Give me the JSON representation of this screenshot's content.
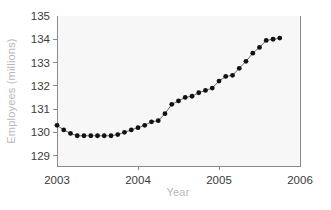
{
  "chart_data": {
    "type": "line",
    "title": "",
    "subtitle": "",
    "xlabel": "Year",
    "ylabel": "Employees (millions)",
    "xlim": [
      2003.0,
      2006.0
    ],
    "ylim": [
      128.55,
      135.0
    ],
    "xticks": [
      2003,
      2004,
      2005,
      2006
    ],
    "xtick_labels": [
      "2003",
      "2004",
      "2005",
      "2006"
    ],
    "yticks": [
      129,
      130,
      131,
      132,
      133,
      134,
      135
    ],
    "ytick_labels": [
      "129",
      "130",
      "131",
      "132",
      "133",
      "134",
      "135"
    ],
    "grid": false,
    "legend": null,
    "marker": "filled-circle",
    "line_color": "#6b6b6b",
    "marker_color": "#111111",
    "plot_background": "#f7f7f8",
    "axis_color": "#8a8a8e",
    "label_color": "#b9b9bd",
    "tick_label_color": "#3b3b3b",
    "series": [
      {
        "name": "Employees",
        "x": [
          2003.0,
          2003.083,
          2003.167,
          2003.25,
          2003.333,
          2003.417,
          2003.5,
          2003.583,
          2003.667,
          2003.75,
          2003.833,
          2003.917,
          2004.0,
          2004.083,
          2004.167,
          2004.25,
          2004.333,
          2004.417,
          2004.5,
          2004.583,
          2004.667,
          2004.75,
          2004.833,
          2004.917,
          2005.0,
          2005.083,
          2005.167,
          2005.25,
          2005.333,
          2005.417,
          2005.5,
          2005.583,
          2005.667,
          2005.75
        ],
        "y": [
          130.3,
          130.1,
          129.95,
          129.85,
          129.85,
          129.85,
          129.85,
          129.85,
          129.85,
          129.9,
          130.0,
          130.1,
          130.2,
          130.3,
          130.45,
          130.5,
          130.8,
          131.2,
          131.35,
          131.5,
          131.55,
          131.7,
          131.8,
          131.9,
          132.2,
          132.4,
          132.45,
          132.75,
          133.05,
          133.4,
          133.65,
          133.95,
          134.0,
          134.05
        ]
      }
    ]
  }
}
